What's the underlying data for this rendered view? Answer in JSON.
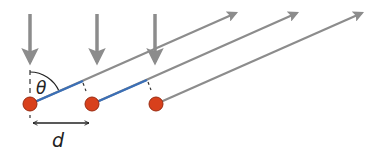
{
  "diagram": {
    "labels": {
      "angle": "θ",
      "spacing": "d"
    },
    "colors": {
      "ray": "#8c8c8c",
      "path_difference": "#3b6fb6",
      "atom_fill": "#d8401c",
      "atom_stroke": "#9a2a10",
      "text": "#222222",
      "dashed": "#333333"
    },
    "atoms": [
      {
        "x": 30,
        "y": 104
      },
      {
        "x": 92,
        "y": 104
      },
      {
        "x": 156,
        "y": 104
      }
    ],
    "incident_arrows": [
      {
        "x": 30,
        "y1": 14,
        "y2": 62
      },
      {
        "x": 97,
        "y1": 14,
        "y2": 62
      },
      {
        "x": 155,
        "y1": 14,
        "y2": 62
      }
    ],
    "diffracted_rays": [
      {
        "from": [
          30,
          104
        ],
        "to": [
          236,
          13
        ]
      },
      {
        "from": [
          92,
          104
        ],
        "to": [
          297,
          13
        ]
      },
      {
        "from": [
          156,
          104
        ],
        "to": [
          362,
          13
        ]
      }
    ]
  }
}
